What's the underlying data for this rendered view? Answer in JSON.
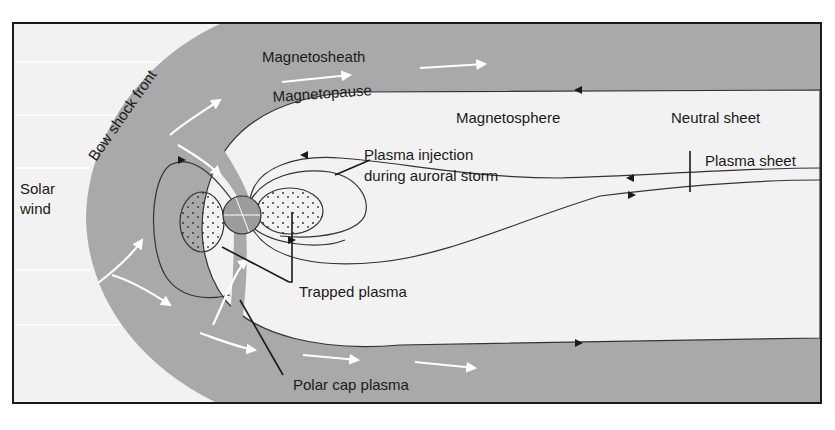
{
  "colors": {
    "background": "#f2f2f2",
    "sheath": "#a9a9a9",
    "earth": "#9c9c9c",
    "line": "#333333",
    "frame": "#1a1a1a",
    "flow_arrow": "#ffffff",
    "plasma_fill": "#ececec"
  },
  "labels": {
    "bow_shock_front": "Bow shock front",
    "magnetosheath": "Magnetosheath",
    "magnetopause": "Magnetopause",
    "magnetosphere": "Magnetosphere",
    "neutral_sheet": "Neutral sheet",
    "plasma_sheet": "Plasma sheet",
    "plasma_injection_line1": "Plasma injection",
    "plasma_injection_line2": "during auroral storm",
    "solar_wind_line1": "Solar",
    "solar_wind_line2": "wind",
    "trapped_plasma": "Trapped plasma",
    "polar_cap_plasma": "Polar cap plasma"
  }
}
